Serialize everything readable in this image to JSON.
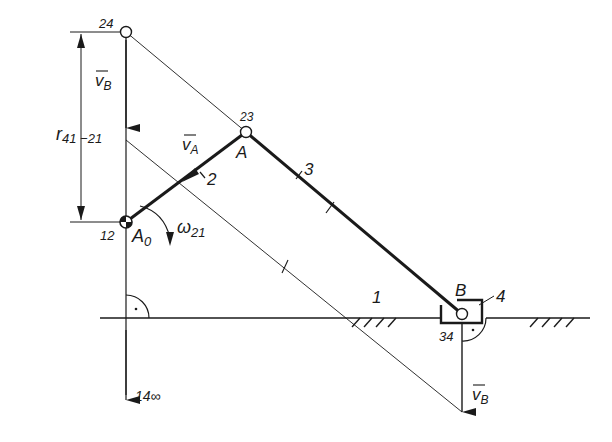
{
  "diagram": {
    "type": "slider-crank mechanism velocity diagram",
    "labels": {
      "pole_24": "24",
      "pole_23": "23",
      "pole_12": "12",
      "pole_34": "34",
      "pole_14": "14∞",
      "point_A": "A",
      "point_B_top": "B",
      "point_A0": "A",
      "point_A0_sub": "0",
      "link_1": "1",
      "link_2": "2",
      "link_3": "3",
      "link_4": "4",
      "vB_top": "v",
      "vB_top_sub": "B",
      "vA": "v",
      "vA_sub": "A",
      "vB_bottom": "v",
      "vB_bottom_sub": "B",
      "omega": "ω",
      "omega_sub": "21",
      "r_dim": "r",
      "r_dim_sub": "41 −21"
    },
    "colors": {
      "ink": "#1a1a1a",
      "background": "#ffffff"
    }
  }
}
